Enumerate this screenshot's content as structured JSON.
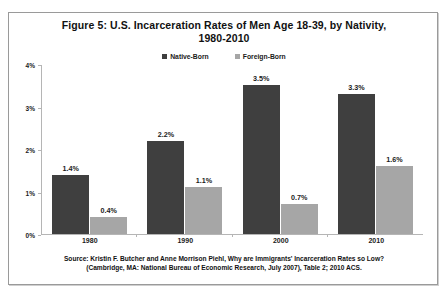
{
  "figure": {
    "title_line1": "Figure 5: U.S. Incarceration Rates of Men Age 18-39, by Nativity,",
    "title_line2": "1980-2010",
    "source_line1": "Source: Kristin F. Butcher and Anne Morrison Piehl, Why are Immigrants' Incarceration Rates so Low?",
    "source_line2": "(Cambridge, MA: National Bureau of Economic Research, July 2007), Table 2; 2010 ACS."
  },
  "colors": {
    "native_born": "#3f3f3f",
    "foreign_born": "#a6a6a6",
    "axis": "#b5b5b5",
    "frame": "#9a9a9a",
    "text": "#111111"
  },
  "chart_data": {
    "type": "bar",
    "title": "Figure 5: U.S. Incarceration Rates of Men Age 18-39, by Nativity, 1980-2010",
    "xlabel": "",
    "ylabel": "",
    "categories": [
      "1980",
      "1990",
      "2000",
      "2010"
    ],
    "ylim": [
      0,
      4
    ],
    "yticks": [
      "0%",
      "1%",
      "2%",
      "3%",
      "4%"
    ],
    "ytick_values": [
      0,
      1,
      2,
      3,
      4
    ],
    "grid": false,
    "legend_position": "top-center",
    "series": [
      {
        "name": "Native-Born",
        "color": "#3f3f3f",
        "values": [
          1.4,
          2.2,
          3.5,
          3.3
        ],
        "labels": [
          "1.4%",
          "2.2%",
          "3.5%",
          "3.3%"
        ]
      },
      {
        "name": "Foreign-Born",
        "color": "#a6a6a6",
        "values": [
          0.4,
          1.1,
          0.7,
          1.6
        ],
        "labels": [
          "0.4%",
          "1.1%",
          "0.7%",
          "1.6%"
        ]
      }
    ]
  }
}
